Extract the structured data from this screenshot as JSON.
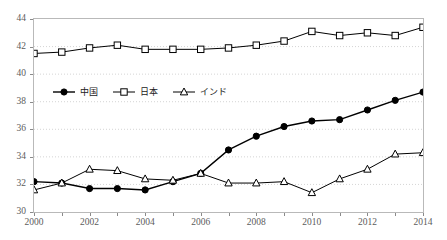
{
  "chart_data": {
    "type": "line",
    "title": "",
    "xlabel": "",
    "ylabel": "",
    "x": [
      2000,
      2001,
      2002,
      2003,
      2004,
      2005,
      2006,
      2007,
      2008,
      2009,
      2010,
      2011,
      2012,
      2013,
      2014
    ],
    "xlim": [
      2000,
      2014
    ],
    "ylim": [
      30,
      44
    ],
    "ytick_values": [
      30,
      32,
      34,
      36,
      38,
      40,
      42,
      44
    ],
    "ytick_labels": [
      "30",
      "32",
      "34",
      "36",
      "38",
      "40",
      "42",
      "44"
    ],
    "xtick_values": [
      2000,
      2002,
      2004,
      2006,
      2008,
      2010,
      2012,
      2014
    ],
    "xtick_labels": [
      "2000",
      "2002",
      "2004",
      "2006",
      "2008",
      "2010",
      "2012",
      "2014"
    ],
    "grid": true,
    "grid_style": "dotted",
    "legend_position": "upper-left-inside",
    "series": [
      {
        "name": "中国",
        "marker": "filled-circle",
        "color": "#000000",
        "values": [
          32.2,
          32.1,
          31.7,
          31.7,
          31.6,
          32.2,
          32.8,
          34.5,
          35.5,
          36.2,
          36.6,
          36.7,
          37.4,
          38.1,
          38.7
        ]
      },
      {
        "name": "日本",
        "marker": "open-square",
        "color": "#000000",
        "values": [
          41.5,
          41.6,
          41.9,
          42.1,
          41.8,
          41.8,
          41.8,
          41.9,
          42.1,
          42.4,
          43.1,
          42.8,
          43.0,
          42.8,
          43.4
        ]
      },
      {
        "name": "インド",
        "marker": "open-triangle",
        "color": "#000000",
        "values": [
          31.6,
          32.1,
          33.1,
          33.0,
          32.4,
          32.3,
          32.8,
          32.1,
          32.1,
          32.2,
          31.4,
          32.4,
          33.1,
          34.2,
          34.3
        ]
      }
    ]
  },
  "legend": {
    "items": [
      {
        "label": "中国",
        "marker": "filled-circle"
      },
      {
        "label": "日本",
        "marker": "open-square"
      },
      {
        "label": "インド",
        "marker": "open-triangle"
      }
    ]
  }
}
